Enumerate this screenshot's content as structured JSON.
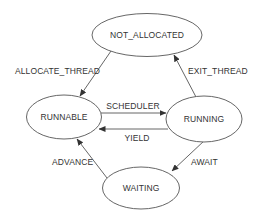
{
  "diagram": {
    "type": "state-machine",
    "colors": {
      "background": "#ffffff",
      "stroke": "#555555",
      "text": "#333333"
    },
    "nodes": [
      {
        "id": "not_allocated",
        "label": "NOT_ALLOCATED",
        "shape": "ellipse"
      },
      {
        "id": "runnable",
        "label": "RUNNABLE",
        "shape": "ellipse"
      },
      {
        "id": "running",
        "label": "RUNNING",
        "shape": "ellipse"
      },
      {
        "id": "waiting",
        "label": "WAITING",
        "shape": "ellipse"
      }
    ],
    "edges": [
      {
        "from": "not_allocated",
        "to": "runnable",
        "label": "ALLOCATE_THREAD"
      },
      {
        "from": "running",
        "to": "not_allocated",
        "label": "EXIT_THREAD"
      },
      {
        "from": "runnable",
        "to": "running",
        "label": "SCHEDULER"
      },
      {
        "from": "running",
        "to": "runnable",
        "label": "YIELD"
      },
      {
        "from": "running",
        "to": "waiting",
        "label": "AWAIT"
      },
      {
        "from": "waiting",
        "to": "runnable",
        "label": "ADVANCE"
      }
    ]
  }
}
